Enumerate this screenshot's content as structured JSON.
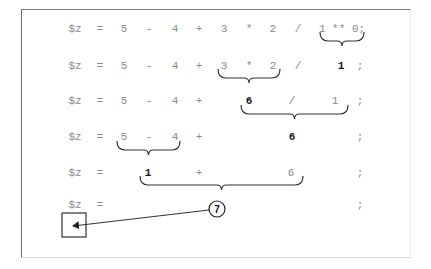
{
  "diagram": {
    "rows": [
      {
        "step": 1,
        "tokens": [
          {
            "text": "$z",
            "x": 75,
            "bold": false
          },
          {
            "text": "=",
            "x": 100,
            "bold": false
          },
          {
            "text": "5",
            "x": 124,
            "bold": false
          },
          {
            "text": "-",
            "x": 149,
            "bold": false
          },
          {
            "text": "4",
            "x": 175,
            "bold": false
          },
          {
            "text": "+",
            "x": 199,
            "bold": false
          },
          {
            "text": "3",
            "x": 224,
            "bold": false
          },
          {
            "text": "*",
            "x": 249,
            "bold": false
          },
          {
            "text": "2",
            "x": 273,
            "bold": false
          },
          {
            "text": "/",
            "x": 298,
            "bold": false
          },
          {
            "text": "1 ** 0;",
            "x": 342,
            "bold": false
          }
        ],
        "y": 29,
        "brace": {
          "x1": 320,
          "x2": 364,
          "y": 35,
          "label": "1 ** 0 → 1"
        }
      },
      {
        "step": 2,
        "tokens": [
          {
            "text": "$z",
            "x": 75,
            "bold": false
          },
          {
            "text": "=",
            "x": 100,
            "bold": false
          },
          {
            "text": "5",
            "x": 124,
            "bold": false
          },
          {
            "text": "-",
            "x": 149,
            "bold": false
          },
          {
            "text": "4",
            "x": 175,
            "bold": false
          },
          {
            "text": "+",
            "x": 199,
            "bold": false
          },
          {
            "text": "3",
            "x": 224,
            "bold": false
          },
          {
            "text": "*",
            "x": 249,
            "bold": false
          },
          {
            "text": "2",
            "x": 273,
            "bold": false
          },
          {
            "text": "/",
            "x": 298,
            "bold": false
          },
          {
            "text": "1",
            "x": 341,
            "bold": true
          },
          {
            "text": ";",
            "x": 360,
            "bold": false
          }
        ],
        "y": 66,
        "brace": {
          "x1": 218,
          "x2": 280,
          "y": 72,
          "label": "3 * 2 → 6"
        }
      },
      {
        "step": 3,
        "tokens": [
          {
            "text": "$z",
            "x": 75,
            "bold": false
          },
          {
            "text": "=",
            "x": 100,
            "bold": false
          },
          {
            "text": "5",
            "x": 124,
            "bold": false
          },
          {
            "text": "-",
            "x": 149,
            "bold": false
          },
          {
            "text": "4",
            "x": 175,
            "bold": false
          },
          {
            "text": "+",
            "x": 199,
            "bold": false
          },
          {
            "text": "6",
            "x": 249,
            "bold": true
          },
          {
            "text": "/",
            "x": 292,
            "bold": false
          },
          {
            "text": "1",
            "x": 335,
            "bold": false
          },
          {
            "text": ";",
            "x": 360,
            "bold": false
          }
        ],
        "y": 101,
        "brace": {
          "x1": 241,
          "x2": 348,
          "y": 108,
          "label": "6 / 1 → 6"
        }
      },
      {
        "step": 4,
        "tokens": [
          {
            "text": "$z",
            "x": 75,
            "bold": false
          },
          {
            "text": "=",
            "x": 100,
            "bold": false
          },
          {
            "text": "5",
            "x": 124,
            "bold": false
          },
          {
            "text": "-",
            "x": 149,
            "bold": false
          },
          {
            "text": "4",
            "x": 175,
            "bold": false
          },
          {
            "text": "+",
            "x": 199,
            "bold": false
          },
          {
            "text": "6",
            "x": 292,
            "bold": true
          },
          {
            "text": ";",
            "x": 360,
            "bold": false
          }
        ],
        "y": 137,
        "brace": {
          "x1": 117,
          "x2": 180,
          "y": 144,
          "label": "5 - 4 → 1"
        }
      },
      {
        "step": 5,
        "tokens": [
          {
            "text": "$z",
            "x": 75,
            "bold": false
          },
          {
            "text": "=",
            "x": 100,
            "bold": false
          },
          {
            "text": "1",
            "x": 148,
            "bold": true
          },
          {
            "text": "+",
            "x": 199,
            "bold": false
          },
          {
            "text": "6",
            "x": 291,
            "bold": false
          },
          {
            "text": ";",
            "x": 360,
            "bold": false
          }
        ],
        "y": 173,
        "brace": {
          "x1": 140,
          "x2": 303,
          "y": 179,
          "label": "1 + 6 → 7"
        }
      },
      {
        "step": 6,
        "tokens": [
          {
            "text": "$z",
            "x": 75,
            "bold": false
          },
          {
            "text": "=",
            "x": 100,
            "bold": false
          },
          {
            "text": ";",
            "x": 360,
            "bold": false
          }
        ],
        "y": 205
      }
    ],
    "result": {
      "value": "7",
      "cx": 217,
      "cy": 209,
      "r": 8
    },
    "assign_box": {
      "x": 62,
      "y": 213,
      "w": 24,
      "h": 24
    },
    "colors": {
      "operand": "#8a8a8a",
      "result": "#1a1a1a",
      "lines": "#333333"
    }
  }
}
